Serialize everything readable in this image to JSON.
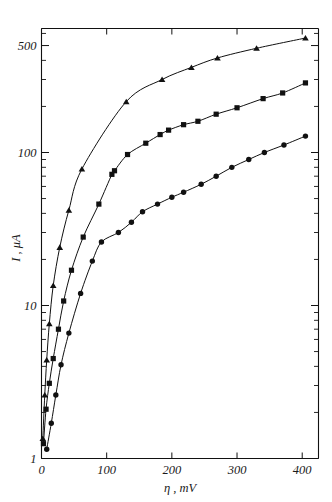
{
  "figure": {
    "background_color": "#ffffff",
    "ink_color": "#111111"
  },
  "chart_data": {
    "type": "scatter",
    "title": "",
    "subtitle": "",
    "xlabel": "η , mV",
    "ylabel": "I , μA",
    "xscale": "linear",
    "yscale": "log",
    "xlim": [
      0,
      425
    ],
    "ylim": [
      1,
      700
    ],
    "grid": false,
    "legend": "none",
    "annotations": [],
    "x_ticks_major": [
      0,
      100,
      200,
      300,
      400
    ],
    "x_tick_labels": [
      "0",
      "100",
      "200",
      "300",
      "400"
    ],
    "y_ticks_labeled": [
      1,
      10,
      100,
      500
    ],
    "y_tick_labels": [
      "1",
      "10",
      "100",
      "500"
    ],
    "y_ticks_minor": [
      2,
      3,
      4,
      5,
      6,
      7,
      8,
      9,
      20,
      30,
      40,
      50,
      60,
      70,
      80,
      90,
      200,
      300,
      400,
      600,
      700
    ],
    "series": [
      {
        "name": "series-triangles",
        "marker": "triangle",
        "marker_label": "▲",
        "color": "#111111",
        "points": [
          [
            2,
            1.35
          ],
          [
            5,
            2.6
          ],
          [
            8,
            4.4
          ],
          [
            12,
            7.6
          ],
          [
            18,
            13.5
          ],
          [
            28,
            24
          ],
          [
            42,
            42
          ],
          [
            62,
            78
          ],
          [
            130,
            215
          ],
          [
            185,
            300
          ],
          [
            230,
            360
          ],
          [
            270,
            415
          ],
          [
            330,
            480
          ],
          [
            405,
            560
          ]
        ]
      },
      {
        "name": "series-squares",
        "marker": "square",
        "marker_label": "■",
        "color": "#111111",
        "points": [
          [
            3,
            1.25
          ],
          [
            7,
            2.1
          ],
          [
            12,
            3.1
          ],
          [
            18,
            4.5
          ],
          [
            26,
            7.0
          ],
          [
            34,
            10.7
          ],
          [
            46,
            17.0
          ],
          [
            64,
            28
          ],
          [
            88,
            46
          ],
          [
            108,
            72
          ],
          [
            112,
            76
          ],
          [
            132,
            97
          ],
          [
            160,
            115
          ],
          [
            182,
            131
          ],
          [
            195,
            140
          ],
          [
            218,
            152
          ],
          [
            240,
            160
          ],
          [
            268,
            178
          ],
          [
            300,
            196
          ],
          [
            340,
            225
          ],
          [
            370,
            245
          ],
          [
            405,
            285
          ]
        ]
      },
      {
        "name": "series-circles",
        "marker": "circle",
        "marker_label": "●",
        "color": "#111111",
        "points": [
          [
            8,
            1.15
          ],
          [
            15,
            1.7
          ],
          [
            22,
            2.6
          ],
          [
            30,
            4.1
          ],
          [
            42,
            6.6
          ],
          [
            60,
            12.0
          ],
          [
            78,
            19.5
          ],
          [
            92,
            26
          ],
          [
            118,
            30
          ],
          [
            138,
            35
          ],
          [
            155,
            41
          ],
          [
            178,
            46
          ],
          [
            200,
            51
          ],
          [
            218,
            55
          ],
          [
            245,
            62
          ],
          [
            268,
            70
          ],
          [
            292,
            80
          ],
          [
            318,
            90
          ],
          [
            342,
            100
          ],
          [
            372,
            112
          ],
          [
            405,
            128
          ]
        ]
      }
    ]
  }
}
